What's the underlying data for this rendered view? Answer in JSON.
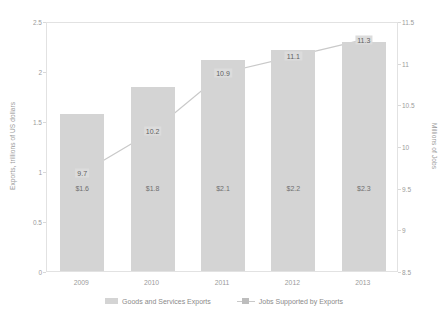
{
  "chart_data": {
    "type": "bar",
    "title": "",
    "categories": [
      "2009",
      "2010",
      "2011",
      "2012",
      "2013"
    ],
    "xlabel": "",
    "ylabel": "Exports, trillions of US dollars",
    "y2label": "Millions of Jobs",
    "ylim": [
      0,
      2.5
    ],
    "y2lim": [
      8.5,
      11.5
    ],
    "yticks": [
      "0",
      "0.5",
      "1",
      "1.5",
      "2",
      "2.5"
    ],
    "ytick_values": [
      0,
      0.5,
      1,
      1.5,
      2,
      2.5
    ],
    "y2ticks": [
      "8.5",
      "9",
      "9.5",
      "10",
      "10.5",
      "11",
      "11.5"
    ],
    "y2tick_values": [
      8.5,
      9,
      9.5,
      10,
      10.5,
      11,
      11.5
    ],
    "grid": false,
    "legend_position": "bottom",
    "series": [
      {
        "name": "Goods and Services Exports",
        "type": "bar",
        "axis": "left",
        "color": "#d4d4d4",
        "values": [
          1.57,
          1.84,
          2.11,
          2.21,
          2.29
        ],
        "data_labels": [
          "$1.6",
          "$1.8",
          "$2.1",
          "$2.2",
          "$2.3"
        ]
      },
      {
        "name": "Jobs Supported by Exports",
        "type": "line",
        "axis": "right",
        "color": "#c9c9c9",
        "values": [
          9.7,
          10.2,
          10.9,
          11.1,
          11.3
        ],
        "data_labels": [
          "9.7",
          "10.2",
          "10.9",
          "11.1",
          "11.3"
        ]
      }
    ]
  },
  "legend": {
    "items": [
      {
        "label": "Goods and Services Exports",
        "marker": "bar-swatch"
      },
      {
        "label": "Jobs Supported by Exports",
        "marker": "line-marker-swatch"
      }
    ]
  },
  "colors": {
    "bar": "#d4d4d4",
    "line": "#c9c9c9",
    "label_box": "#dcdcdc",
    "axis": "#e2e2e2",
    "text": "#9b9b9b",
    "background": "#ffffff"
  }
}
